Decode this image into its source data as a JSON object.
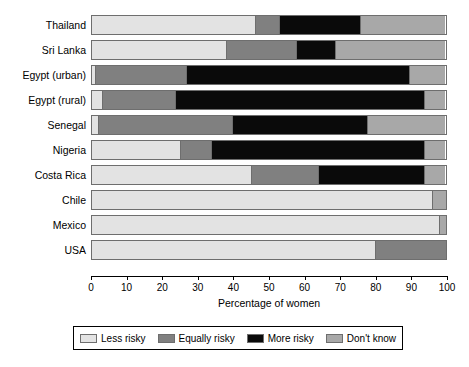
{
  "chart_data": {
    "type": "bar",
    "orientation": "horizontal",
    "stacked": true,
    "stacked_mode": "percent",
    "title": "",
    "subtitle": "",
    "xlabel": "Percentage of women",
    "ylabel": "",
    "xlim": [
      0,
      100
    ],
    "xticks": [
      0,
      10,
      20,
      30,
      40,
      50,
      60,
      70,
      80,
      90,
      100
    ],
    "xticklabels": [
      "0",
      "10",
      "20",
      "30",
      "40",
      "50",
      "60",
      "70",
      "80",
      "90",
      "100"
    ],
    "grid": false,
    "legend_position": "bottom",
    "categories": [
      "Thailand",
      "Sri Lanka",
      "Egypt (urban)",
      "Egypt (rural)",
      "Senegal",
      "Nigeria",
      "Costa Rica",
      "Chile",
      "Mexico",
      "USA"
    ],
    "series": [
      {
        "name": "Less risky",
        "color": "#e3e3e3",
        "values": [
          46,
          38,
          1,
          3,
          2,
          25,
          45,
          96,
          98,
          80
        ]
      },
      {
        "name": "Equally risky",
        "color": "#808080",
        "values": [
          7,
          20,
          26,
          21,
          38,
          9,
          19,
          0,
          0,
          20
        ]
      },
      {
        "name": "More risky",
        "color": "#0a0a0a",
        "values": [
          23,
          11,
          63,
          70,
          38,
          60,
          30,
          0,
          0,
          0
        ]
      },
      {
        "name": "Don't know",
        "color": "#a8a8a8",
        "values": [
          24,
          31,
          10,
          6,
          22,
          6,
          6,
          4,
          2,
          0
        ]
      }
    ]
  },
  "legend": {
    "items": [
      {
        "label": "Less risky",
        "color": "#e3e3e3"
      },
      {
        "label": "Equally risky",
        "color": "#808080"
      },
      {
        "label": "More risky",
        "color": "#0a0a0a"
      },
      {
        "label": "Don't know",
        "color": "#a8a8a8"
      }
    ]
  },
  "colors": {
    "less_risky": "#e3e3e3",
    "equally_risky": "#808080",
    "more_risky": "#0a0a0a",
    "dont_know": "#a8a8a8",
    "axis": "#000000",
    "bar_outline": "#6e6e6e",
    "background": "#ffffff"
  }
}
